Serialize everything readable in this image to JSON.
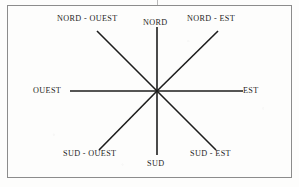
{
  "figure": {
    "kind": "compass-rose-diagram",
    "language": "fr",
    "border_color": "#8c8c8c",
    "line_color": "#1d1d1d",
    "text_color": "#1d1d1d",
    "background_color": "#fdfdfc"
  },
  "compass": {
    "center": {
      "x": 157,
      "y": 91
    },
    "directions": [
      {
        "key": "north",
        "label": "NORD",
        "angle_deg": 90,
        "end": {
          "x": 157,
          "y": 27
        }
      },
      {
        "key": "northwest",
        "label": "NORD - OUEST",
        "angle_deg": 135,
        "end": {
          "x": 97,
          "y": 31
        }
      },
      {
        "key": "northeast",
        "label": "NORD - EST",
        "angle_deg": 45,
        "end": {
          "x": 218,
          "y": 31
        }
      },
      {
        "key": "west",
        "label": "OUEST",
        "angle_deg": 180,
        "end": {
          "x": 70,
          "y": 91
        }
      },
      {
        "key": "east",
        "label": "EST",
        "angle_deg": 0,
        "end": {
          "x": 243,
          "y": 91
        }
      },
      {
        "key": "south",
        "label": "SUD",
        "angle_deg": 270,
        "end": {
          "x": 157,
          "y": 155
        }
      },
      {
        "key": "southwest",
        "label": "SUD - OUEST",
        "angle_deg": 225,
        "end": {
          "x": 99,
          "y": 150
        }
      },
      {
        "key": "southeast",
        "label": "SUD - EST",
        "angle_deg": 315,
        "end": {
          "x": 216,
          "y": 150
        }
      }
    ]
  }
}
